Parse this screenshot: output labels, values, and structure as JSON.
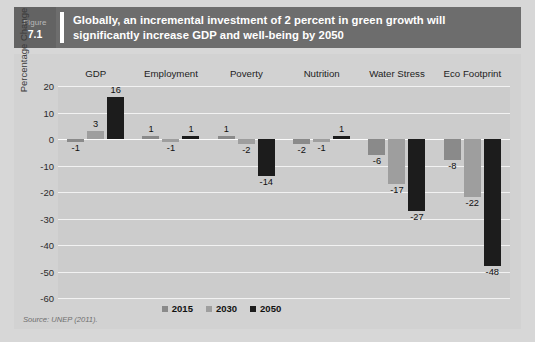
{
  "figure": {
    "label_word": "Figure",
    "number": "7.1",
    "title": "Globally, an incremental investment of 2 percent in green growth will significantly increase GDP and well-being by 2050"
  },
  "source_note": "Source: UNEP (2011).",
  "colors": {
    "banner": "#6d6d6d",
    "number_block": "#636363",
    "page_background": "#d7d7d7",
    "plot_background": "#cccccc",
    "gridline": "#f2f2f2",
    "series_2015": "#8a8a8a",
    "series_2030": "#9e9e9e",
    "series_2050": "#1c1c1c"
  },
  "chart_data": {
    "type": "bar",
    "title": "Globally, an incremental investment of 2 percent in green growth will significantly increase GDP and well-being by 2050",
    "xlabel": "",
    "ylabel": "Percentage Change",
    "ylim": [
      -60,
      20
    ],
    "yticks": [
      20,
      10,
      0,
      -10,
      -20,
      -30,
      -40,
      -50,
      -60
    ],
    "ytick_labels": [
      "20",
      "10",
      "0",
      "-10",
      "-20",
      "-30",
      "-40",
      "-50",
      "-60"
    ],
    "grid": true,
    "legend_position": "bottom",
    "categories": [
      "GDP",
      "Employment",
      "Poverty",
      "Nutrition",
      "Water Stress",
      "Eco Footprint"
    ],
    "series": [
      {
        "name": "2015",
        "color": "#8a8a8a",
        "values": [
          -1,
          1,
          1,
          -2,
          -6,
          -8
        ]
      },
      {
        "name": "2030",
        "color": "#9e9e9e",
        "values": [
          3,
          -1,
          -2,
          -1,
          -17,
          -22
        ]
      },
      {
        "name": "2050",
        "color": "#1c1c1c",
        "values": [
          16,
          1,
          -14,
          1,
          -27,
          -48
        ]
      }
    ],
    "data_labels": [
      {
        "category": "GDP",
        "series": "2015",
        "label": "-1"
      },
      {
        "category": "GDP",
        "series": "2030",
        "label": "3"
      },
      {
        "category": "GDP",
        "series": "2050",
        "label": "16"
      },
      {
        "category": "Employment",
        "series": "2015",
        "label": "1"
      },
      {
        "category": "Employment",
        "series": "2030",
        "label": "-1"
      },
      {
        "category": "Employment",
        "series": "2050",
        "label": "1"
      },
      {
        "category": "Poverty",
        "series": "2015",
        "label": "1"
      },
      {
        "category": "Poverty",
        "series": "2030",
        "label": "-2"
      },
      {
        "category": "Poverty",
        "series": "2050",
        "label": "-14"
      },
      {
        "category": "Nutrition",
        "series": "2015",
        "label": "-2"
      },
      {
        "category": "Nutrition",
        "series": "2030",
        "label": "-1"
      },
      {
        "category": "Nutrition",
        "series": "2050",
        "label": "1"
      },
      {
        "category": "Water Stress",
        "series": "2015",
        "label": "-6"
      },
      {
        "category": "Water Stress",
        "series": "2030",
        "label": "-17"
      },
      {
        "category": "Water Stress",
        "series": "2050",
        "label": "-27"
      },
      {
        "category": "Eco Footprint",
        "series": "2015",
        "label": "-8"
      },
      {
        "category": "Eco Footprint",
        "series": "2030",
        "label": "-22"
      },
      {
        "category": "Eco Footprint",
        "series": "2050",
        "label": "-48"
      }
    ]
  }
}
